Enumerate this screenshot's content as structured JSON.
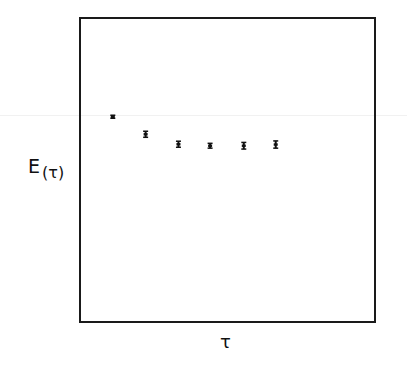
{
  "chart_data": {
    "type": "scatter",
    "title": "",
    "xlabel": "τ",
    "ylabel": "E(τ)",
    "ylabel_main": "E",
    "ylabel_arg": "(τ)",
    "grid": false,
    "legend": null,
    "x_ticks": [],
    "y_ticks": [],
    "xlim": [
      0,
      1
    ],
    "ylim": [
      0,
      1
    ],
    "note": "No tick labels shown; values are normalized positions within the plot frame (0 = left/bottom edge, 1 = right/top edge).",
    "series": [
      {
        "name": "E(τ)",
        "marker": "point with error bar",
        "x": [
          0.112,
          0.224,
          0.336,
          0.444,
          0.559,
          0.668
        ],
        "values": [
          0.673,
          0.615,
          0.582,
          0.577,
          0.577,
          0.581
        ],
        "errors": [
          0.005,
          0.01,
          0.01,
          0.008,
          0.011,
          0.012
        ]
      }
    ]
  }
}
